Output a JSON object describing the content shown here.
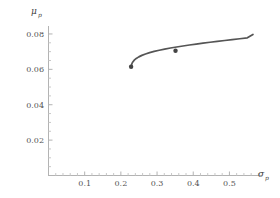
{
  "chart_data": {
    "type": "line",
    "title": "",
    "subtitle": "",
    "xlabel": "σ",
    "xlabel_sub": "p",
    "ylabel": "μ",
    "ylabel_sub": "p",
    "xlim": [
      0.0,
      0.59
    ],
    "ylim": [
      0.0,
      0.0845
    ],
    "xticks": [
      0.1,
      0.2,
      0.3,
      0.4,
      0.5
    ],
    "xtick_labels": [
      "0.1",
      "0.2",
      "0.3",
      "0.4",
      "0.5"
    ],
    "yticks": [
      0.02,
      0.04,
      0.06,
      0.08
    ],
    "ytick_labels": [
      "0.02",
      "0.04",
      "0.06",
      "0.08"
    ],
    "minor_ticks": true,
    "grid": false,
    "legend": null,
    "legend_position": "none",
    "curve_color": "#555555",
    "axis_color": "#b3b3b3",
    "marker_color": "#444444",
    "series": [
      {
        "name": "efficient-frontier",
        "x": [
          0.228,
          0.229,
          0.2305,
          0.233,
          0.237,
          0.2425,
          0.2495,
          0.258,
          0.268,
          0.2795,
          0.292,
          0.306,
          0.321,
          0.337,
          0.354,
          0.3715,
          0.3895,
          0.408,
          0.427,
          0.4465,
          0.4665,
          0.487,
          0.5075,
          0.5285,
          0.5495,
          0.565
        ],
        "y": [
          0.0615,
          0.0623,
          0.0632,
          0.0642,
          0.0652,
          0.06615,
          0.06705,
          0.0679,
          0.0687,
          0.06945,
          0.07015,
          0.0708,
          0.07145,
          0.07205,
          0.07265,
          0.0732,
          0.07375,
          0.0743,
          0.0748,
          0.0753,
          0.0758,
          0.0763,
          0.0768,
          0.0773,
          0.0778,
          0.0797
        ]
      }
    ],
    "markers": [
      {
        "name": "minimum-variance-point",
        "x": 0.2283,
        "y": 0.0615
      },
      {
        "name": "tangency-point",
        "x": 0.351,
        "y": 0.0705
      }
    ]
  }
}
